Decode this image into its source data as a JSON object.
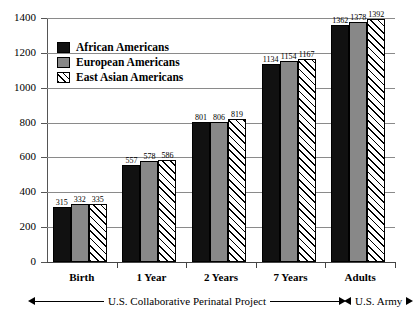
{
  "chart_data": {
    "type": "bar",
    "title": "",
    "subtitle": "",
    "xlabel": "",
    "ylabel": "",
    "grid": true,
    "legend_position": "upper-left-inside",
    "ylim": [
      0,
      1400
    ],
    "yticks": [
      1400,
      1200,
      1000,
      800,
      600,
      400,
      200,
      0
    ],
    "ytick_labels": [
      "1400",
      "1200",
      "1000",
      "800",
      "600",
      "400",
      "200",
      "0"
    ],
    "categories": [
      "Birth",
      "1 Year",
      "2 Years",
      "7 Years",
      "Adults"
    ],
    "series": [
      {
        "name": "African Americans",
        "pattern": "solid-black",
        "color": "#111111",
        "values": [
          315,
          557,
          801,
          1134,
          1362
        ]
      },
      {
        "name": "European Americans",
        "pattern": "solid-gray",
        "color": "#888888",
        "values": [
          332,
          578,
          806,
          1154,
          1378
        ]
      },
      {
        "name": "East Asian Americans",
        "pattern": "diagonal-hatch",
        "color": "#ffffff",
        "values": [
          335,
          586,
          819,
          1167,
          1392
        ]
      }
    ],
    "annotations": [
      {
        "text": "U.S. Collaborative  Perinatal Project",
        "arrows": "both",
        "spans": [
          "Birth",
          "7 Years"
        ]
      },
      {
        "text": "U.S. Army",
        "arrows": "both",
        "spans": [
          "Adults"
        ]
      }
    ]
  },
  "legend": {
    "items": [
      {
        "label": "African Americans"
      },
      {
        "label": "European Americans"
      },
      {
        "label": "East Asian Americans"
      }
    ]
  }
}
